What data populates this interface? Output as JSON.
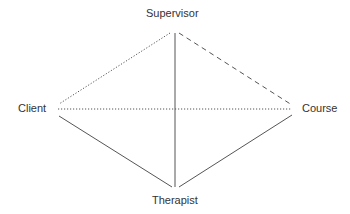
{
  "diagram": {
    "nodes": [
      {
        "id": "supervisor",
        "label": "Supervisor",
        "x": 175,
        "y": 32
      },
      {
        "id": "client",
        "label": "Client",
        "x": 58,
        "y": 108
      },
      {
        "id": "course",
        "label": "Course",
        "x": 292,
        "y": 110
      },
      {
        "id": "therapist",
        "label": "Therapist",
        "x": 175,
        "y": 188
      }
    ],
    "edges": [
      {
        "from": "supervisor",
        "to": "client",
        "style": "dotted"
      },
      {
        "from": "supervisor",
        "to": "course",
        "style": "dashed"
      },
      {
        "from": "supervisor",
        "to": "therapist",
        "style": "solid"
      },
      {
        "from": "client",
        "to": "course",
        "style": "dotted"
      },
      {
        "from": "client",
        "to": "therapist",
        "style": "solid"
      },
      {
        "from": "course",
        "to": "therapist",
        "style": "solid"
      }
    ],
    "line_color": "#555555"
  }
}
